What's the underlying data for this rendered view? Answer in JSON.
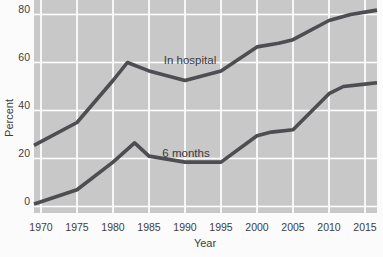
{
  "figure": {
    "background_color": "#fbfbfb",
    "plot_background_color": "#c8c8c8",
    "gridline_color": "#ffffff",
    "line_color": "#4d4d52",
    "text_color": "#3d3d3d"
  },
  "chart_data": {
    "type": "line",
    "title": "",
    "xlabel": "Year",
    "ylabel": "Percent",
    "x_ticks": [
      1970,
      1975,
      1980,
      1985,
      1990,
      1995,
      2000,
      2005,
      2010,
      2015
    ],
    "y_ticks": [
      0,
      20,
      40,
      60,
      80
    ],
    "xlim": [
      1969,
      2016.8
    ],
    "ylim": [
      -2.7,
      86
    ],
    "grid": "white major gridlines on gray plot area; horizontal every 20 percent, vertical every 5 years",
    "legend_position": "inline labels above each line",
    "series": [
      {
        "name": "In hospital",
        "points": [
          [
            1970,
            27
          ],
          [
            1975,
            35
          ],
          [
            1980,
            52.5
          ],
          [
            1982,
            60
          ],
          [
            1985,
            56.5
          ],
          [
            1990,
            52.5
          ],
          [
            1995,
            56.5
          ],
          [
            2000,
            66.5
          ],
          [
            2003,
            68
          ],
          [
            2005,
            69.5
          ],
          [
            2010,
            77.5
          ],
          [
            2013,
            80
          ],
          [
            2015,
            81
          ]
        ]
      },
      {
        "name": "6 months",
        "points": [
          [
            1970,
            2
          ],
          [
            1975,
            7
          ],
          [
            1980,
            18.5
          ],
          [
            1983,
            26.5
          ],
          [
            1985,
            21
          ],
          [
            1990,
            18.5
          ],
          [
            1995,
            18.5
          ],
          [
            2000,
            29.5
          ],
          [
            2002,
            31
          ],
          [
            2005,
            32
          ],
          [
            2010,
            47
          ],
          [
            2012,
            50
          ],
          [
            2015,
            51
          ]
        ]
      }
    ]
  }
}
